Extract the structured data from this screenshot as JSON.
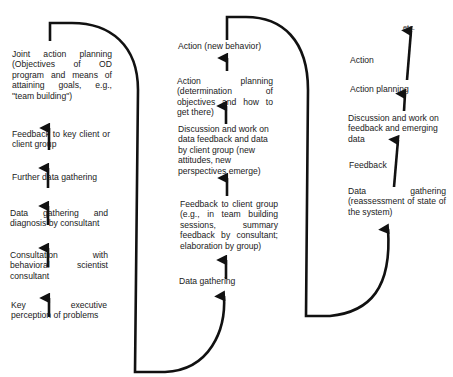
{
  "diagram": {
    "type": "action-research-cycle",
    "line_color": "#111111",
    "text_color": "#1a1a1a",
    "columns": [
      {
        "id": "cycle-1",
        "steps_bottom_to_top": [
          "Key executive perception of problems",
          "Consultation with behavioral scientist consultant",
          "Data gathering and diagnosis by consultant",
          "Further data gathering",
          "Feedback to key client or client group",
          "Joint action planning (Objectives of OD program and means of attaining goals, e.g., \"team building\")"
        ]
      },
      {
        "id": "cycle-2",
        "steps_bottom_to_top": [
          "Data gathering",
          "Feedback to client group (e.g., in team building sessions, summary feedback by consultant; elaboration by group)",
          "Discussion and work on data feedback and data by client group (new attitudes, new perspectives emerge)",
          "Action planning (determination of objectives and how to get there)",
          "Action (new behavior)"
        ]
      },
      {
        "id": "cycle-3",
        "steps_bottom_to_top": [
          "Data gathering (reassessment of state of the system)",
          "Feedback",
          "Discussion and work on feedback and emerging data",
          "Action planning",
          "Action",
          "etc."
        ]
      }
    ]
  },
  "labels": {
    "c1": {
      "joint_action": "Joint action planning (Objectives of OD program and means of attaining goals, e.g., \"team building\")",
      "feedback": "Feedback to key client or client group",
      "further": "Further data gathering",
      "diagnosis": "Data gathering and diagnosis by consultant",
      "consultation": "Consultation with behavioral scientist consultant",
      "perception": "Key executive perception of problems"
    },
    "c2": {
      "action": "Action (new behavior)",
      "planning": "Action planning (determination of objectives and how to get there)",
      "discussion": "Discussion and work on data feedback and data by client group (new attitudes, new perspectives emerge)",
      "feedback": "Feedback to client group (e.g., in team building sessions, summary feedback by consultant; elaboration by group)",
      "data": "Data gathering"
    },
    "c3": {
      "etc": "etc.",
      "action": "Action",
      "planning": "Action planning",
      "discussion": "Discussion and work on feedback and emerging data",
      "feedback": "Feedback",
      "data": "Data gathering (reassessment of state of the system)"
    }
  }
}
